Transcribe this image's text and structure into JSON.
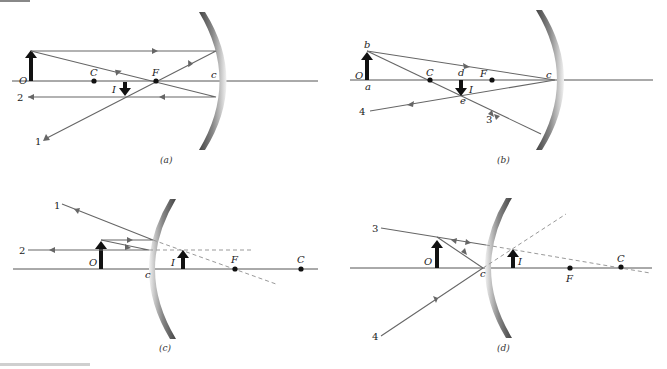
{
  "figure": {
    "header_strip": "",
    "diagrams": [
      {
        "id": "a",
        "caption": "(a)",
        "mirror": "concave",
        "labels": {
          "object": "O",
          "center": "C",
          "focus": "F",
          "vertex": "c",
          "image": "I"
        },
        "rays": [
          "1",
          "2"
        ]
      },
      {
        "id": "b",
        "caption": "(b)",
        "mirror": "concave",
        "labels": {
          "object": "O",
          "object_base": "a",
          "object_tip": "b",
          "center": "C",
          "image_base": "d",
          "image_tip": "e",
          "image": "I",
          "focus": "F",
          "vertex": "c"
        },
        "rays": [
          "3",
          "4"
        ]
      },
      {
        "id": "c",
        "caption": "(c)",
        "mirror": "convex",
        "labels": {
          "object": "O",
          "vertex": "c",
          "image": "I",
          "focus": "F",
          "center": "C"
        },
        "rays": [
          "1",
          "2"
        ]
      },
      {
        "id": "d",
        "caption": "(d)",
        "mirror": "convex",
        "labels": {
          "object": "O",
          "vertex": "c",
          "image": "I",
          "focus": "F",
          "center": "C"
        },
        "rays": [
          "3",
          "4"
        ]
      }
    ]
  }
}
